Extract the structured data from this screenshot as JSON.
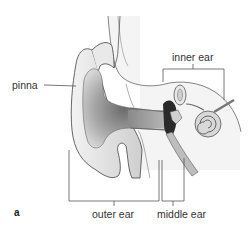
{
  "figure": {
    "panel_label": "a",
    "labels": {
      "pinna": "pinna",
      "inner_ear": "inner ear",
      "outer_ear": "outer ear",
      "middle_ear": "middle ear"
    },
    "colors": {
      "line": "#555555",
      "skin_light": "#e6e6e6",
      "skin_mid": "#c8c8c8",
      "canal_dark": "#6e6e6e",
      "cavity": "#2a2a2a",
      "bone_fill": "#efefef"
    }
  }
}
